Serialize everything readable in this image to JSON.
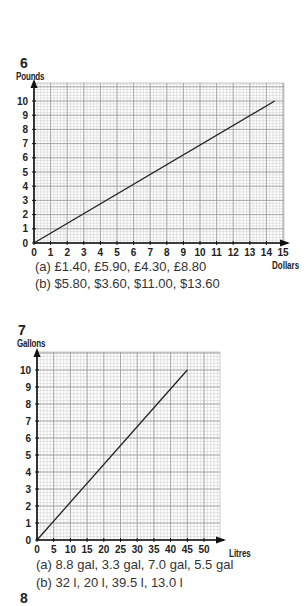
{
  "chart_data": [
    {
      "type": "line",
      "question_number": "6",
      "title": "",
      "xlabel": "Dollars",
      "ylabel": "Pounds",
      "xlim": [
        0,
        15
      ],
      "ylim": [
        0,
        10
      ],
      "x_ticks": [
        "0",
        "1",
        "2",
        "3",
        "4",
        "5",
        "6",
        "7",
        "8",
        "9",
        "10",
        "11",
        "12",
        "13",
        "14",
        "15"
      ],
      "y_ticks": [
        "0",
        "1",
        "2",
        "3",
        "4",
        "5",
        "6",
        "7",
        "8",
        "9",
        "10"
      ],
      "grid": true,
      "series": [
        {
          "name": "conversion",
          "x": [
            0,
            14.5
          ],
          "y": [
            0,
            10
          ]
        }
      ],
      "answers": {
        "a": "(a)  £1.40, £5.90, £4.30, £8.80",
        "b": "(b)  $5.80, $3.60, $11.00, $13.60"
      }
    },
    {
      "type": "line",
      "question_number": "7",
      "title": "",
      "xlabel": "Litres",
      "ylabel": "Gallons",
      "xlim": [
        0,
        50
      ],
      "ylim": [
        0,
        10
      ],
      "x_ticks": [
        "0",
        "5",
        "10",
        "15",
        "20",
        "25",
        "30",
        "35",
        "40",
        "45",
        "50"
      ],
      "y_ticks": [
        "0",
        "1",
        "2",
        "3",
        "4",
        "5",
        "6",
        "7",
        "8",
        "9",
        "10"
      ],
      "grid": true,
      "series": [
        {
          "name": "conversion",
          "x": [
            0,
            45
          ],
          "y": [
            0,
            10
          ]
        }
      ],
      "answers": {
        "a": "(a)   8.8 gal, 3.3 gal, 7.0 gal, 5.5 gal",
        "b": "(b)  32 l, 20 l, 39.5 l, 13.0 l"
      }
    }
  ],
  "next_question_number": "8"
}
